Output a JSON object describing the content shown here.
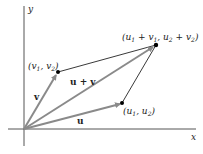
{
  "diagram": {
    "axes": {
      "x_label": "x",
      "y_label": "y"
    },
    "vectors": [
      {
        "name": "u",
        "label": "u",
        "point_label": "(u1, u2)"
      },
      {
        "name": "v",
        "label": "v",
        "point_label": "(v1, v2)"
      },
      {
        "name": "u+v",
        "label": "u + v",
        "point_label": "(u1 + v1, u2 + v2)"
      }
    ],
    "colors": {
      "vector": "#8a8a8a",
      "edge": "#222222",
      "axis": "#555555",
      "point": "#000000"
    }
  }
}
